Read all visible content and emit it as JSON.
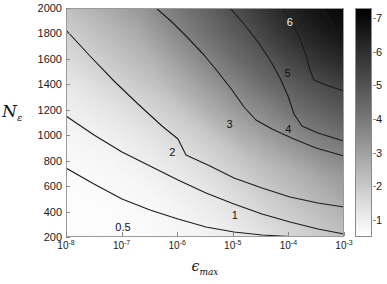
{
  "chart_data": {
    "type": "contour",
    "title": "",
    "xlabel": "ϵmax",
    "ylabel": "Nε",
    "xscale": "log",
    "yscale": "linear",
    "xlim": [
      1e-08,
      0.001
    ],
    "ylim": [
      200,
      2000
    ],
    "xtick_labels": [
      "10",
      "10",
      "10",
      "10",
      "10",
      "10"
    ],
    "xtick_exponents": [
      "-8",
      "-7",
      "-6",
      "-5",
      "-4",
      "-3"
    ],
    "xtick_values": [
      1e-08,
      1e-07,
      1e-06,
      1e-05,
      0.0001,
      0.001
    ],
    "ytick_labels": [
      "200",
      "400",
      "600",
      "800",
      "1000",
      "1200",
      "1400",
      "1600",
      "1800",
      "2000"
    ],
    "ytick_values": [
      200,
      400,
      600,
      800,
      1000,
      1200,
      1400,
      1600,
      1800,
      2000
    ],
    "grid": false,
    "colormap": "grayscale-inverted",
    "colorbar": {
      "position": "right",
      "vmin": 0.5,
      "vmax": 7.3,
      "tick_labels": [
        "1",
        "2",
        "3",
        "4",
        "5",
        "6",
        "7"
      ],
      "tick_values": [
        1,
        2,
        3,
        4,
        5,
        6,
        7
      ]
    },
    "contour_levels": [
      0.5,
      1,
      2,
      3,
      4,
      5,
      6
    ],
    "contour_labels": [
      {
        "level": "0.5",
        "x_frac": 0.205,
        "y_frac": 0.955,
        "style": "dark"
      },
      {
        "level": "1",
        "x_frac": 0.607,
        "y_frac": 0.905,
        "style": "dark"
      },
      {
        "level": "2",
        "x_frac": 0.382,
        "y_frac": 0.63,
        "style": "dark"
      },
      {
        "level": "3",
        "x_frac": 0.588,
        "y_frac": 0.508,
        "style": "dark"
      },
      {
        "level": "4",
        "x_frac": 0.8,
        "y_frac": 0.53,
        "style": "dark"
      },
      {
        "level": "5",
        "x_frac": 0.797,
        "y_frac": 0.282,
        "style": "dark"
      },
      {
        "level": "6",
        "x_frac": 0.805,
        "y_frac": 0.062,
        "style": "light"
      }
    ],
    "contour_paths": {
      "c0_5": "M 0 160 L 28 176 L 56 191 L 84 202 L 112 211 L 140 219 L 168 224 L 196 227 L 224 228.5 L 252 229 L 278 229",
      "c1": "M 0 108 L 28 127 L 56 144 L 84 158 L 112 172 L 140 185 L 168 196 L 196 206 L 224 214 L 252 221 L 278 226",
      "c2": "M 0 22 L 24 48 L 48 73 L 72 96 L 96 118 L 112 131 L 120 147 L 144 158 L 168 170 L 196 180 L 224 189 L 252 195 L 278 199",
      "c3": "M 90 0 L 106 14 L 122 30 L 138 47 L 152 64 L 166 82 L 178 99 L 190 112 L 206 121 L 228 131 L 250 140 L 278 148",
      "c4": "M 164 0 L 178 16 L 192 34 L 204 52 L 214 70 L 222 88 L 228 106 L 236 118 L 252 125 L 268 130 L 278 133",
      "c5": "M 216 0 L 226 15 L 234 31 L 240 47 L 244 62 L 248 72 L 260 77 L 272 81 L 278 83",
      "c6": "M 256 0 L 262 9 L 266 18 L 270 26 L 276 30 L 278 31"
    }
  }
}
